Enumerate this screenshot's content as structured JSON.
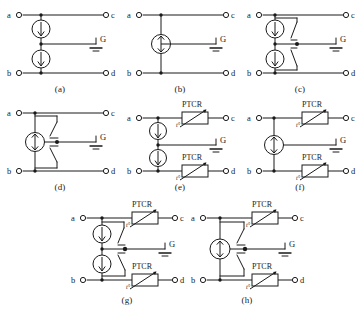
{
  "figure": {
    "background_color": "#ffffff",
    "line_color": "#1a1a1a",
    "rows": [
      3,
      3,
      2
    ]
  },
  "labels": {
    "terminal_a": "a",
    "terminal_b": "b",
    "terminal_c": "c",
    "terminal_d": "d",
    "ground": "G",
    "ptcr": "PTCR",
    "temp_marker": "t°"
  },
  "panels": [
    {
      "id": "a",
      "caption": "(a)",
      "terminals": [
        "a",
        "b",
        "c",
        "d"
      ],
      "ground_label": "G",
      "devices": [
        {
          "type": "gas-discharge-tube",
          "terminals": 2,
          "position": "upper"
        },
        {
          "type": "gas-discharge-tube",
          "terminals": 2,
          "position": "lower"
        }
      ],
      "ptcr_count": 0,
      "switch_count": 0
    },
    {
      "id": "b",
      "caption": "(b)",
      "terminals": [
        "a",
        "b",
        "c",
        "d"
      ],
      "ground_label": "G",
      "devices": [
        {
          "type": "gas-discharge-tube",
          "terminals": 3,
          "position": "center"
        }
      ],
      "ptcr_count": 0,
      "switch_count": 0
    },
    {
      "id": "c",
      "caption": "(c)",
      "terminals": [
        "a",
        "b",
        "c",
        "d"
      ],
      "ground_label": "G",
      "devices": [
        {
          "type": "gas-discharge-tube",
          "terminals": 2,
          "position": "upper"
        },
        {
          "type": "gas-discharge-tube",
          "terminals": 2,
          "position": "lower"
        }
      ],
      "ptcr_count": 0,
      "switch_count": 2
    },
    {
      "id": "d",
      "caption": "(d)",
      "terminals": [
        "a",
        "b",
        "c",
        "d"
      ],
      "ground_label": "G",
      "devices": [
        {
          "type": "gas-discharge-tube",
          "terminals": 3,
          "position": "center"
        }
      ],
      "ptcr_count": 0,
      "switch_count": 2
    },
    {
      "id": "e",
      "caption": "(e)",
      "terminals": [
        "a",
        "b",
        "c",
        "d"
      ],
      "ground_label": "G",
      "devices": [
        {
          "type": "gas-discharge-tube",
          "terminals": 2,
          "position": "upper"
        },
        {
          "type": "gas-discharge-tube",
          "terminals": 2,
          "position": "lower"
        }
      ],
      "ptcr_count": 2,
      "ptcr_labels": [
        "PTCR",
        "PTCR"
      ],
      "switch_count": 0
    },
    {
      "id": "f",
      "caption": "(f)",
      "terminals": [
        "a",
        "b",
        "c",
        "d"
      ],
      "ground_label": "G",
      "devices": [
        {
          "type": "gas-discharge-tube",
          "terminals": 3,
          "position": "center"
        }
      ],
      "ptcr_count": 2,
      "ptcr_labels": [
        "PTCR",
        "PTCR"
      ],
      "switch_count": 0
    },
    {
      "id": "g",
      "caption": "(g)",
      "terminals": [
        "a",
        "b",
        "c",
        "d"
      ],
      "ground_label": "G",
      "devices": [
        {
          "type": "gas-discharge-tube",
          "terminals": 2,
          "position": "upper"
        },
        {
          "type": "gas-discharge-tube",
          "terminals": 2,
          "position": "lower"
        }
      ],
      "ptcr_count": 2,
      "ptcr_labels": [
        "PTCR",
        "PTCR"
      ],
      "switch_count": 2
    },
    {
      "id": "h",
      "caption": "(h)",
      "terminals": [
        "a",
        "b",
        "c",
        "d"
      ],
      "ground_label": "G",
      "devices": [
        {
          "type": "gas-discharge-tube",
          "terminals": 3,
          "position": "center"
        }
      ],
      "ptcr_count": 2,
      "ptcr_labels": [
        "PTCR",
        "PTCR"
      ],
      "switch_count": 2
    }
  ]
}
